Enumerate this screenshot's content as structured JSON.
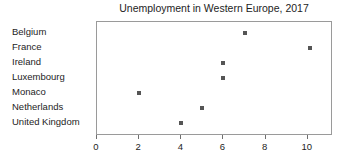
{
  "chart_data": {
    "type": "scatter",
    "title": "Unemployment in Western Europe, 2017",
    "xlabel": "",
    "ylabel": "",
    "orientation": "horizontal",
    "grid": false,
    "legend": false,
    "xlim": [
      0,
      11.2
    ],
    "xticks": [
      0,
      2,
      4,
      6,
      8,
      10
    ],
    "xtick_labels": [
      "0",
      "2",
      "4",
      "6",
      "8",
      "10"
    ],
    "categories": [
      "Belgium",
      "France",
      "Ireland",
      "Luxembourg",
      "Monaco",
      "Netherlands",
      "United Kingdom"
    ],
    "values": [
      7,
      10.1,
      6,
      6,
      2,
      5,
      4
    ],
    "marker_color": "#555555",
    "marker_shape": "square",
    "frame_color": "#9a9a9a",
    "points": [
      {
        "category": "Belgium",
        "value": 7
      },
      {
        "category": "France",
        "value": 10.1
      },
      {
        "category": "Ireland",
        "value": 6
      },
      {
        "category": "Luxembourg",
        "value": 6
      },
      {
        "category": "Monaco",
        "value": 2
      },
      {
        "category": "Netherlands",
        "value": 5
      },
      {
        "category": "United Kingdom",
        "value": 4
      }
    ]
  }
}
